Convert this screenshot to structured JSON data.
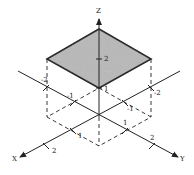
{
  "diagram": {
    "type": "3d-coordinate-plot",
    "colors": {
      "ink": "#222222",
      "fill": "#b8b8b8",
      "background": "#ffffff"
    },
    "axes": {
      "x": {
        "label": "X",
        "ticks": [
          "1",
          "2"
        ],
        "negative_ticks": [
          "-1",
          "-2"
        ]
      },
      "y": {
        "label": "Y",
        "ticks": [
          "1",
          "2"
        ],
        "negative_ticks": [
          "-1",
          "-2"
        ]
      },
      "z": {
        "label": "Z",
        "ticks": [
          "1",
          "2"
        ]
      }
    },
    "labels": {
      "z_axis": "Z",
      "x_axis": "X",
      "y_axis": "Y",
      "z_tick_2": "2",
      "z_tick_1": "1",
      "x_tick_1": "1",
      "x_tick_2": "2",
      "y_tick_1": "1",
      "y_tick_2": "2",
      "negx_tick_1": "-1",
      "negx_tick_2": "-2",
      "negy_tick_1": "-1",
      "negy_tick_2": "-2"
    },
    "surface": {
      "shape": "square",
      "z": 2,
      "x_range": [
        -1,
        1
      ],
      "y_range": [
        -1,
        1
      ],
      "shaded": true
    },
    "projection": {
      "shape": "square",
      "z": 0,
      "style": "dashed"
    }
  }
}
